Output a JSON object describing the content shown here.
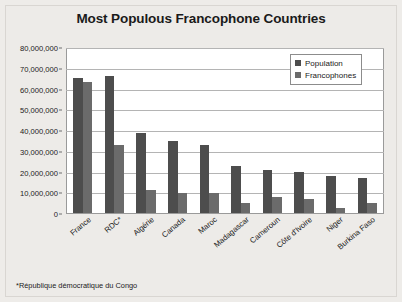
{
  "figure": {
    "title": "Most Populous Francophone Countries",
    "footnote": "*République démocratique du Congo",
    "background_color": "#edebe8",
    "plot_background_color": "#ffffff",
    "border_color": "#9a9a9a"
  },
  "legend": {
    "position": "top-right",
    "entries": [
      {
        "label": "Population",
        "color": "#4d4d4d"
      },
      {
        "label": "Francophones",
        "color": "#6b6b6b"
      }
    ]
  },
  "chart_data": {
    "type": "bar",
    "title": "Most Populous Francophone Countries",
    "xlabel": "",
    "ylabel": "",
    "ylim": [
      0,
      80000000
    ],
    "grid": true,
    "legend_position": "top-right",
    "categories": [
      "France",
      "RDC*",
      "Algérie",
      "Canada",
      "Maroc",
      "Madagascar",
      "Cameroun",
      "Côte d'Ivoire",
      "Niger",
      "Burkina Faso"
    ],
    "series": [
      {
        "name": "Population",
        "color": "#4d4d4d",
        "values": [
          66000000,
          67000000,
          39000000,
          35000000,
          33000000,
          23000000,
          21000000,
          20000000,
          18000000,
          17000000
        ]
      },
      {
        "name": "Francophones",
        "color": "#6b6b6b",
        "values": [
          64000000,
          33000000,
          11000000,
          10000000,
          10000000,
          5000000,
          8000000,
          7000000,
          2500000,
          5000000
        ]
      }
    ],
    "yticks": [
      0,
      10000000,
      20000000,
      30000000,
      40000000,
      50000000,
      60000000,
      70000000,
      80000000
    ],
    "ytick_labels": [
      "0",
      "10,000,000",
      "20,000,000",
      "30,000,000",
      "40,000,000",
      "50,000,000",
      "60,000,000",
      "70,000,000",
      "80,000,000"
    ],
    "annotations": [
      "*République démocratique du Congo"
    ]
  }
}
